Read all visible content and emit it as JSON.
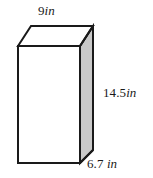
{
  "figure": {
    "name": "rectangular-prism",
    "colors": {
      "edge": "#1a1a1a",
      "front_face": "#ffffff",
      "top_face": "#ffffff",
      "right_face": "#c9c9c9",
      "background": "#ffffff"
    },
    "geometry": {
      "front_top_left": [
        18,
        46
      ],
      "front_top_right": [
        80,
        46
      ],
      "front_bottom_left": [
        18,
        163
      ],
      "front_bottom_right": [
        80,
        163
      ],
      "back_top_left": [
        31,
        26
      ],
      "back_top_right": [
        93,
        26
      ],
      "back_bottom_right": [
        93,
        150
      ]
    }
  },
  "labels": {
    "width": {
      "value": "9",
      "unit": "in",
      "edge": "top-front-horizontal"
    },
    "height": {
      "value": "14.5",
      "unit": "in",
      "edge": "right-vertical"
    },
    "depth": {
      "value": "6.7",
      "unit": " in",
      "edge": "bottom-right-diagonal"
    }
  }
}
